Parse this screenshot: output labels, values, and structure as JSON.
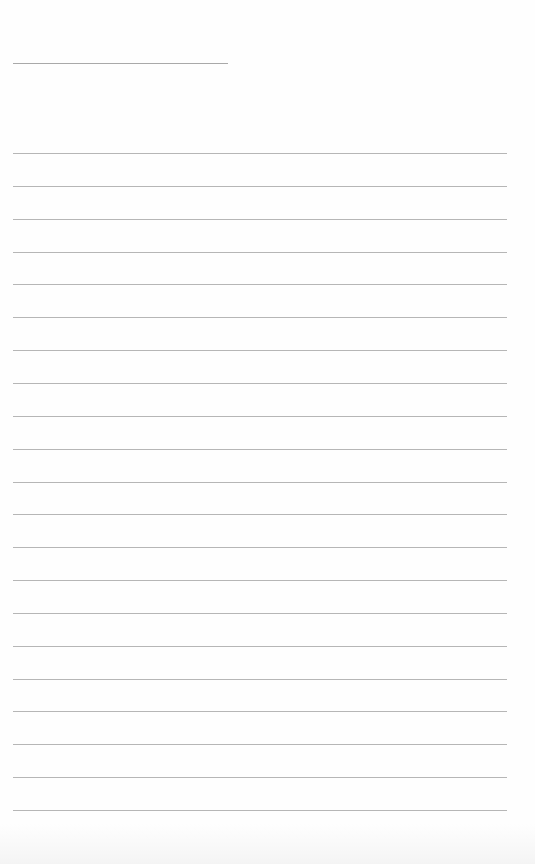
{
  "page": {
    "type": "lined-paper",
    "background": "#fefefe",
    "header_line": {
      "x": 13,
      "y": 63,
      "width": 215,
      "color": "#a9a9a9"
    },
    "ruled_lines": {
      "count": 21,
      "x": 13,
      "first_y": 153,
      "last_y": 810,
      "spacing": 32.85,
      "width": 494,
      "color": "#b6b6b6"
    }
  }
}
